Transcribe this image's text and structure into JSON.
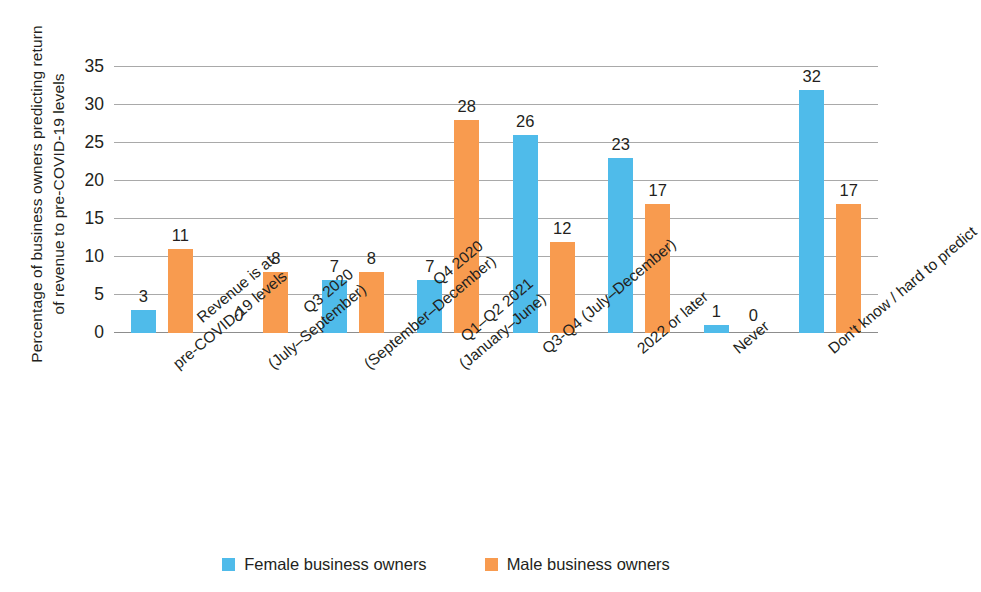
{
  "chart_data": {
    "type": "bar",
    "title": "",
    "xlabel": "",
    "ylabel_line1": "Percentage of business owners predicting return",
    "ylabel_line2": "of revenue to pre-COVID-19 levels",
    "ylim": [
      0,
      35
    ],
    "yticks": [
      0,
      5,
      10,
      15,
      20,
      25,
      30,
      35
    ],
    "grid": true,
    "legend_position": "bottom",
    "categories": [
      {
        "line1": "Revenue is at",
        "line2": "pre-COVID-19 levels"
      },
      {
        "line1": "Q3 2020",
        "line2": "(July–September)"
      },
      {
        "line1": "Q4 2020",
        "line2": "(September–December)"
      },
      {
        "line1": "Q1–Q2 2021",
        "line2": "(January–June)"
      },
      {
        "line1": "Q3-Q4 (July–December)",
        "line2": ""
      },
      {
        "line1": "2022 or later",
        "line2": ""
      },
      {
        "line1": "Never",
        "line2": ""
      },
      {
        "line1": "Don't know / hard to predict",
        "line2": ""
      }
    ],
    "series": [
      {
        "name": "Female business owners",
        "color": "#4fbbea",
        "values": [
          3,
          0,
          7,
          7,
          26,
          23,
          1,
          32
        ]
      },
      {
        "name": "Male business owners",
        "color": "#f89b4f",
        "values": [
          11,
          8,
          8,
          28,
          12,
          17,
          0,
          17
        ]
      }
    ]
  },
  "legend": {
    "items": [
      {
        "label": "Female business owners",
        "swatch": "female"
      },
      {
        "label": "Male business owners",
        "swatch": "male"
      }
    ]
  },
  "axis": {
    "ytick_labels": [
      "0",
      "5",
      "10",
      "15",
      "20",
      "25",
      "30",
      "35"
    ]
  }
}
